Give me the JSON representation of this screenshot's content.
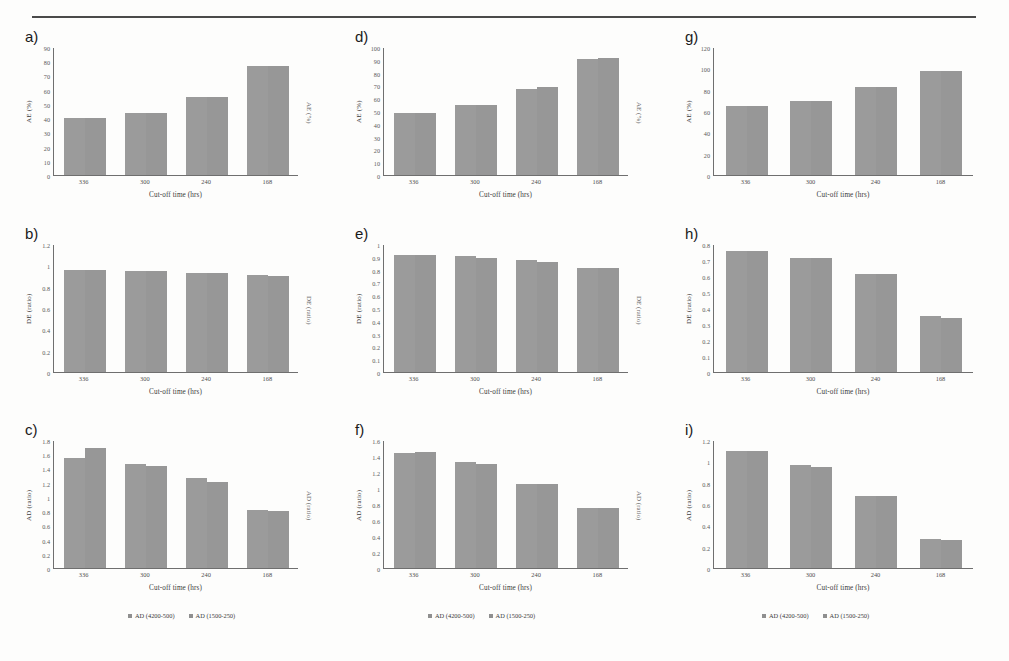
{
  "figure": {
    "panels": [
      {
        "label": "a)",
        "ylabel": "AE (%)",
        "ylabel_right": "AE (%)",
        "xlabel": "Cut-off time (hrs)",
        "yticks": [
          "0",
          "10",
          "20",
          "30",
          "40",
          "50",
          "60",
          "70",
          "80",
          "90"
        ],
        "xticks": [
          "336",
          "300",
          "240",
          "168"
        ]
      },
      {
        "label": "d)",
        "ylabel": "AE (%)",
        "ylabel_right": "AE (%)",
        "xlabel": "Cut-off time (hrs)",
        "yticks": [
          "0",
          "10",
          "20",
          "30",
          "40",
          "50",
          "60",
          "70",
          "80",
          "90",
          "100"
        ],
        "xticks": [
          "336",
          "300",
          "240",
          "168"
        ]
      },
      {
        "label": "g)",
        "ylabel": "AE (%)",
        "ylabel_right": "",
        "xlabel": "Cut-off time (hrs)",
        "yticks": [
          "0",
          "20",
          "40",
          "60",
          "80",
          "100",
          "120"
        ],
        "xticks": [
          "336",
          "300",
          "240",
          "168"
        ]
      },
      {
        "label": "b)",
        "ylabel": "DE (ratio)",
        "ylabel_right": "DE (ratio)",
        "xlabel": "Cut-off time (hrs)",
        "yticks": [
          "0",
          "0.2",
          "0.4",
          "0.6",
          "0.8",
          "1",
          "1.2"
        ],
        "xticks": [
          "336",
          "300",
          "240",
          "168"
        ]
      },
      {
        "label": "e)",
        "ylabel": "DE (ratio)",
        "ylabel_right": "DE (ratio)",
        "xlabel": "Cut-off time (hrs)",
        "yticks": [
          "0",
          "0.1",
          "0.2",
          "0.3",
          "0.4",
          "0.5",
          "0.6",
          "0.7",
          "0.8",
          "0.9",
          "1"
        ],
        "xticks": [
          "336",
          "300",
          "240",
          "168"
        ]
      },
      {
        "label": "h)",
        "ylabel": "DE (ratio)",
        "ylabel_right": "",
        "xlabel": "Cut-off time (hrs)",
        "yticks": [
          "0",
          "0.1",
          "0.2",
          "0.3",
          "0.4",
          "0.5",
          "0.6",
          "0.7",
          "0.8"
        ],
        "xticks": [
          "336",
          "300",
          "240",
          "168"
        ]
      },
      {
        "label": "c)",
        "ylabel": "AD (ratio)",
        "ylabel_right": "AD (ratio)",
        "xlabel": "Cut-off time (hrs)",
        "yticks": [
          "0",
          "0.2",
          "0.4",
          "0.6",
          "0.8",
          "1",
          "1.2",
          "1.4",
          "1.6",
          "1.8"
        ],
        "xticks": [
          "336",
          "300",
          "240",
          "168"
        ]
      },
      {
        "label": "f)",
        "ylabel": "AD (ratio)",
        "ylabel_right": "AD (ratio)",
        "xlabel": "Cut-off time (hrs)",
        "yticks": [
          "0",
          "0.2",
          "0.4",
          "0.6",
          "0.8",
          "1",
          "1.2",
          "1.4",
          "1.6"
        ],
        "xticks": [
          "336",
          "300",
          "240",
          "168"
        ]
      },
      {
        "label": "i)",
        "ylabel": "AD (ratio)",
        "ylabel_right": "",
        "xlabel": "Cut-off time (hrs)",
        "yticks": [
          "0",
          "0.2",
          "0.4",
          "0.6",
          "0.8",
          "1",
          "1.2"
        ],
        "xticks": [
          "336",
          "300",
          "240",
          "168"
        ]
      }
    ],
    "legends": [
      {
        "id": "legend-a",
        "items": [
          "AD (4200-500)",
          "AD (1500-250)"
        ]
      },
      {
        "id": "legend-b",
        "items": [
          "AD (4200-500)",
          "AD (1500-250)"
        ]
      },
      {
        "id": "legend-c",
        "items": [
          "AD (4200-500)",
          "AD (1500-250)"
        ]
      }
    ],
    "colors": {
      "bar_series_1": "#9b9b9b",
      "bar_series_2": "#979797",
      "axis": "#6f6f6f",
      "rule": "#4a4a4a",
      "background": "#fdfdfc"
    }
  },
  "chart_data": [
    {
      "type": "bar",
      "panel": "a",
      "title": "",
      "xlabel": "Cut-off time (hrs)",
      "ylabel": "AE (%)",
      "categories": [
        "336",
        "300",
        "240",
        "168"
      ],
      "ylim": [
        0,
        90
      ],
      "ytick_step": 10,
      "grid": false,
      "series": [
        {
          "name": "AD (4200-500)",
          "values": [
            40,
            44,
            55,
            77
          ]
        },
        {
          "name": "AD (1500-250)",
          "values": [
            40,
            44,
            55,
            77
          ]
        }
      ]
    },
    {
      "type": "bar",
      "panel": "d",
      "title": "",
      "xlabel": "Cut-off time (hrs)",
      "ylabel": "AE (%)",
      "categories": [
        "336",
        "300",
        "240",
        "168"
      ],
      "ylim": [
        0,
        100
      ],
      "ytick_step": 10,
      "grid": false,
      "series": [
        {
          "name": "AD (4200-500)",
          "values": [
            49,
            55,
            68,
            91
          ]
        },
        {
          "name": "AD (1500-250)",
          "values": [
            49,
            55,
            69,
            92
          ]
        }
      ]
    },
    {
      "type": "bar",
      "panel": "g",
      "title": "",
      "xlabel": "Cut-off time (hrs)",
      "ylabel": "AE (%)",
      "categories": [
        "336",
        "300",
        "240",
        "168"
      ],
      "ylim": [
        0,
        120
      ],
      "ytick_step": 20,
      "grid": false,
      "series": [
        {
          "name": "AD (4200-500)",
          "values": [
            65,
            70,
            83,
            98
          ]
        },
        {
          "name": "AD (1500-250)",
          "values": [
            65,
            70,
            83,
            98
          ]
        }
      ]
    },
    {
      "type": "bar",
      "panel": "b",
      "title": "",
      "xlabel": "Cut-off time (hrs)",
      "ylabel": "DE (ratio)",
      "categories": [
        "336",
        "300",
        "240",
        "168"
      ],
      "ylim": [
        0,
        1.2
      ],
      "ytick_step": 0.2,
      "grid": false,
      "series": [
        {
          "name": "AD (4200-500)",
          "values": [
            0.96,
            0.95,
            0.94,
            0.92
          ]
        },
        {
          "name": "AD (1500-250)",
          "values": [
            0.96,
            0.95,
            0.94,
            0.91
          ]
        }
      ]
    },
    {
      "type": "bar",
      "panel": "e",
      "title": "",
      "xlabel": "Cut-off time (hrs)",
      "ylabel": "DE (ratio)",
      "categories": [
        "336",
        "300",
        "240",
        "168"
      ],
      "ylim": [
        0,
        1.0
      ],
      "ytick_step": 0.1,
      "grid": false,
      "series": [
        {
          "name": "AD (4200-500)",
          "values": [
            0.92,
            0.91,
            0.88,
            0.82
          ]
        },
        {
          "name": "AD (1500-250)",
          "values": [
            0.92,
            0.9,
            0.87,
            0.82
          ]
        }
      ]
    },
    {
      "type": "bar",
      "panel": "h",
      "title": "",
      "xlabel": "Cut-off time (hrs)",
      "ylabel": "DE (ratio)",
      "categories": [
        "336",
        "300",
        "240",
        "168"
      ],
      "ylim": [
        0,
        0.8
      ],
      "ytick_step": 0.1,
      "grid": false,
      "series": [
        {
          "name": "AD (4200-500)",
          "values": [
            0.76,
            0.72,
            0.62,
            0.35
          ]
        },
        {
          "name": "AD (1500-250)",
          "values": [
            0.76,
            0.72,
            0.62,
            0.34
          ]
        }
      ]
    },
    {
      "type": "bar",
      "panel": "c",
      "title": "",
      "xlabel": "Cut-off time (hrs)",
      "ylabel": "AD (ratio)",
      "categories": [
        "336",
        "300",
        "240",
        "168"
      ],
      "ylim": [
        0,
        1.8
      ],
      "ytick_step": 0.2,
      "grid": false,
      "series": [
        {
          "name": "AD (4200-500)",
          "values": [
            1.56,
            1.48,
            1.27,
            0.82
          ]
        },
        {
          "name": "AD (1500-250)",
          "values": [
            1.7,
            1.45,
            1.22,
            0.8
          ]
        }
      ]
    },
    {
      "type": "bar",
      "panel": "f",
      "title": "",
      "xlabel": "Cut-off time (hrs)",
      "ylabel": "AD (ratio)",
      "categories": [
        "336",
        "300",
        "240",
        "168"
      ],
      "ylim": [
        0,
        1.6
      ],
      "ytick_step": 0.2,
      "grid": false,
      "series": [
        {
          "name": "AD (4200-500)",
          "values": [
            1.45,
            1.33,
            1.06,
            0.75
          ]
        },
        {
          "name": "AD (1500-250)",
          "values": [
            1.46,
            1.31,
            1.06,
            0.75
          ]
        }
      ]
    },
    {
      "type": "bar",
      "panel": "i",
      "title": "",
      "xlabel": "Cut-off time (hrs)",
      "ylabel": "AD (ratio)",
      "categories": [
        "336",
        "300",
        "240",
        "168"
      ],
      "ylim": [
        0,
        1.2
      ],
      "ytick_step": 0.2,
      "grid": false,
      "series": [
        {
          "name": "AD (4200-500)",
          "values": [
            1.11,
            0.97,
            0.68,
            0.27
          ]
        },
        {
          "name": "AD (1500-250)",
          "values": [
            1.11,
            0.95,
            0.68,
            0.26
          ]
        }
      ]
    }
  ]
}
